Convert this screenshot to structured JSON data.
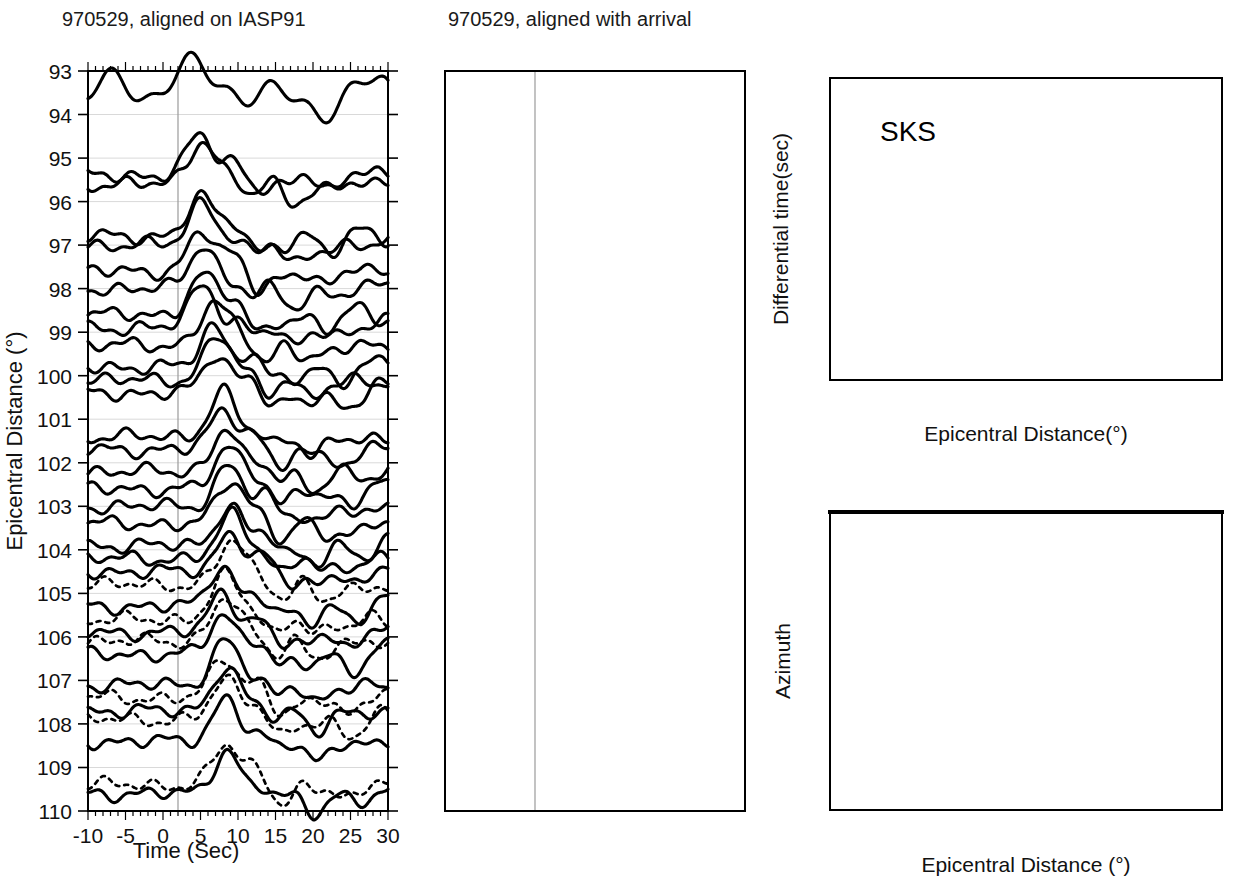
{
  "figure": {
    "panels": {
      "left": {
        "title": "970529, aligned on IASP91",
        "xlabel": "Time (Sec)",
        "ylabel": "Epicentral Distance (°)",
        "xticks": [
          "-10",
          "-5",
          "0",
          "5",
          "10",
          "15",
          "20",
          "25",
          "30"
        ],
        "xtick_values": [
          -10,
          -5,
          0,
          5,
          10,
          15,
          20,
          25,
          30
        ],
        "yticks": [
          "93",
          "94",
          "95",
          "96",
          "97",
          "98",
          "99",
          "100",
          "101",
          "102",
          "103",
          "104",
          "105",
          "106",
          "107",
          "108",
          "109",
          "110"
        ],
        "ytick_values": [
          93,
          94,
          95,
          96,
          97,
          98,
          99,
          100,
          101,
          102,
          103,
          104,
          105,
          106,
          107,
          108,
          109,
          110
        ],
        "xlim": [
          -10,
          30
        ],
        "ylim": [
          93,
          110
        ],
        "align_marker_time": 0
      },
      "middle": {
        "title": "970529, aligned with arrival",
        "xlabel": "Time (Sec)",
        "xticks": [
          "-10",
          "-5",
          "0",
          "5",
          "10",
          "15",
          "20",
          "25",
          "30"
        ],
        "xtick_values": [
          -10,
          -5,
          0,
          5,
          10,
          15,
          20,
          25,
          30
        ],
        "xlim": [
          -10,
          30
        ],
        "ylim": [
          93,
          110
        ],
        "align_marker_time": 0
      },
      "topright": {
        "annotation": "SKS",
        "xlabel": "Epicentral Distance(°)",
        "ylabel": "Differential time(sec)",
        "xticks": [
          "96",
          "98",
          "100",
          "102",
          "104",
          "106",
          "108",
          "110"
        ],
        "xtick_values": [
          96,
          98,
          100,
          102,
          104,
          106,
          108,
          110
        ],
        "yticks": [
          "10",
          "8",
          "6",
          "4",
          "2",
          "0",
          "-2",
          "-4"
        ],
        "ytick_values": [
          10,
          8,
          6,
          4,
          2,
          0,
          -2,
          -4
        ],
        "xlim": [
          95,
          110
        ],
        "ylim": [
          -5,
          10
        ]
      },
      "bottomright": {
        "xlabel": "Epicentral Distance (°)",
        "ylabel": "Azimuth",
        "xticks": [
          "96",
          "98",
          "100",
          "102",
          "104",
          "106",
          "108",
          "110"
        ],
        "xtick_values": [
          96,
          98,
          100,
          102,
          104,
          106,
          108,
          110
        ],
        "yticks": [
          "130",
          "132",
          "134",
          "136"
        ],
        "ytick_values": [
          130,
          132,
          134,
          136
        ],
        "xlim": [
          95,
          110
        ],
        "ylim": [
          136,
          130
        ]
      }
    }
  },
  "chart_data": [
    {
      "type": "line",
      "id": "left-record-section",
      "title": "970529, aligned on IASP91",
      "xlabel": "Time (Sec)",
      "ylabel": "Epicentral Distance (°)",
      "xlim": [
        -10,
        30
      ],
      "ylim": [
        93,
        110
      ],
      "grid": true,
      "legend": "none",
      "note": "Record section; each trace is a seismogram plotted at its epicentral distance. Dotted traces are synthetics/second phase shown for 104.5-110 deg.",
      "traces": [
        {
          "distance": 93.6,
          "style": "solid"
        },
        {
          "distance": 95.4,
          "style": "solid"
        },
        {
          "distance": 95.6,
          "style": "solid"
        },
        {
          "distance": 96.8,
          "style": "solid"
        },
        {
          "distance": 97.0,
          "style": "solid"
        },
        {
          "distance": 97.6,
          "style": "solid"
        },
        {
          "distance": 98.0,
          "style": "solid"
        },
        {
          "distance": 98.6,
          "style": "solid"
        },
        {
          "distance": 98.9,
          "style": "solid"
        },
        {
          "distance": 99.3,
          "style": "solid"
        },
        {
          "distance": 99.8,
          "style": "solid"
        },
        {
          "distance": 100.1,
          "style": "solid"
        },
        {
          "distance": 100.4,
          "style": "solid"
        },
        {
          "distance": 101.4,
          "style": "solid"
        },
        {
          "distance": 101.7,
          "style": "solid"
        },
        {
          "distance": 102.2,
          "style": "solid"
        },
        {
          "distance": 102.6,
          "style": "solid"
        },
        {
          "distance": 103.0,
          "style": "solid"
        },
        {
          "distance": 103.4,
          "style": "solid"
        },
        {
          "distance": 103.9,
          "style": "solid"
        },
        {
          "distance": 104.2,
          "style": "solid"
        },
        {
          "distance": 104.5,
          "style": "solid"
        },
        {
          "distance": 104.8,
          "style": "dotted"
        },
        {
          "distance": 105.3,
          "style": "solid"
        },
        {
          "distance": 105.6,
          "style": "dotted"
        },
        {
          "distance": 105.9,
          "style": "solid"
        },
        {
          "distance": 106.1,
          "style": "dotted"
        },
        {
          "distance": 106.4,
          "style": "solid"
        },
        {
          "distance": 107.1,
          "style": "solid"
        },
        {
          "distance": 107.4,
          "style": "dotted"
        },
        {
          "distance": 107.7,
          "style": "solid"
        },
        {
          "distance": 107.9,
          "style": "dotted"
        },
        {
          "distance": 108.4,
          "style": "solid"
        },
        {
          "distance": 109.4,
          "style": "dotted"
        },
        {
          "distance": 109.6,
          "style": "solid"
        }
      ]
    },
    {
      "type": "line",
      "id": "middle-record-section",
      "title": "970529, aligned with arrival",
      "xlabel": "Time (Sec)",
      "ylabel": "",
      "xlim": [
        -10,
        30
      ],
      "ylim": [
        93,
        110
      ],
      "grid": true,
      "legend": "none",
      "note": "Same traces realigned on the picked arrival time so the SKS onset lines up at t=0.",
      "traces": [
        {
          "distance": 93.6,
          "style": "solid"
        },
        {
          "distance": 95.3,
          "style": "solid"
        },
        {
          "distance": 95.7,
          "style": "solid"
        },
        {
          "distance": 96.7,
          "style": "solid"
        },
        {
          "distance": 97.0,
          "style": "solid"
        },
        {
          "distance": 97.6,
          "style": "solid"
        },
        {
          "distance": 98.1,
          "style": "solid"
        },
        {
          "distance": 98.5,
          "style": "solid"
        },
        {
          "distance": 98.9,
          "style": "solid"
        },
        {
          "distance": 99.4,
          "style": "solid"
        },
        {
          "distance": 99.8,
          "style": "solid"
        },
        {
          "distance": 100.2,
          "style": "solid"
        },
        {
          "distance": 100.5,
          "style": "solid"
        },
        {
          "distance": 101.3,
          "style": "solid"
        },
        {
          "distance": 101.8,
          "style": "solid"
        },
        {
          "distance": 102.2,
          "style": "solid"
        },
        {
          "distance": 102.6,
          "style": "solid"
        },
        {
          "distance": 103.1,
          "style": "solid"
        },
        {
          "distance": 103.5,
          "style": "solid"
        },
        {
          "distance": 103.9,
          "style": "solid"
        },
        {
          "distance": 104.3,
          "style": "solid"
        },
        {
          "distance": 104.7,
          "style": "solid"
        },
        {
          "distance": 105.1,
          "style": "solid"
        },
        {
          "distance": 105.5,
          "style": "solid"
        },
        {
          "distance": 105.9,
          "style": "solid"
        },
        {
          "distance": 106.3,
          "style": "solid"
        },
        {
          "distance": 107.0,
          "style": "solid"
        },
        {
          "distance": 107.5,
          "style": "solid"
        },
        {
          "distance": 108.0,
          "style": "solid"
        },
        {
          "distance": 108.5,
          "style": "solid"
        },
        {
          "distance": 109.3,
          "style": "solid"
        },
        {
          "distance": 109.7,
          "style": "solid"
        }
      ]
    },
    {
      "type": "scatter",
      "id": "sks-differential-time",
      "title": "SKS",
      "xlabel": "Epicentral Distance(°)",
      "ylabel": "Differential time(sec)",
      "xlim": [
        95,
        110
      ],
      "ylim": [
        -5,
        10
      ],
      "grid": false,
      "legend": "none",
      "series": [
        {
          "name": "solid-triangle",
          "marker": "filled-triangle",
          "points": [
            [
              95.05,
              2.05
            ],
            [
              95.65,
              1.75
            ],
            [
              95.6,
              1.5
            ],
            [
              96.35,
              1.45
            ],
            [
              96.85,
              1.8
            ],
            [
              96.9,
              0.3
            ],
            [
              97.45,
              1.55
            ],
            [
              97.6,
              1.5
            ],
            [
              97.8,
              0.15
            ],
            [
              98.45,
              1.5
            ],
            [
              98.6,
              1.8
            ],
            [
              98.7,
              1.25
            ],
            [
              99.1,
              1.15
            ],
            [
              99.15,
              0.75
            ],
            [
              99.55,
              1.4
            ],
            [
              99.6,
              2.15
            ],
            [
              100.2,
              1.95
            ],
            [
              100.25,
              2.1
            ],
            [
              100.35,
              2.0
            ],
            [
              101.0,
              3.3
            ],
            [
              101.5,
              4.0
            ],
            [
              101.6,
              3.85
            ],
            [
              102.3,
              4.1
            ],
            [
              102.5,
              5.1
            ],
            [
              103.0,
              5.15
            ],
            [
              103.3,
              5.0
            ],
            [
              103.5,
              5.15
            ],
            [
              103.7,
              5.25
            ],
            [
              103.85,
              5.3
            ],
            [
              104.3,
              4.9
            ],
            [
              104.5,
              4.8
            ],
            [
              104.75,
              4.6
            ],
            [
              104.9,
              4.65
            ],
            [
              104.95,
              4.2
            ],
            [
              105.4,
              4.4
            ],
            [
              106.0,
              4.55
            ],
            [
              107.15,
              4.85
            ],
            [
              107.4,
              4.75
            ],
            [
              107.5,
              4.75
            ],
            [
              107.75,
              4.8
            ],
            [
              108.6,
              5.0
            ],
            [
              109.35,
              4.85
            ]
          ]
        },
        {
          "name": "open-triangle",
          "marker": "open-triangle",
          "points": [
            [
              105.2,
              5.7
            ],
            [
              105.6,
              5.35
            ],
            [
              105.8,
              5.25
            ],
            [
              106.1,
              5.65
            ],
            [
              107.15,
              5.65
            ],
            [
              107.45,
              5.95
            ],
            [
              108.5,
              6.1
            ],
            [
              109.3,
              6.35
            ]
          ]
        }
      ],
      "fit_curve": {
        "name": "model-fit",
        "style": "solid-thick",
        "points": [
          [
            95.05,
            0.82
          ],
          [
            97.0,
            0.82
          ],
          [
            98.9,
            0.8
          ],
          [
            99.2,
            0.9
          ],
          [
            100.0,
            2.1
          ],
          [
            101.0,
            3.35
          ],
          [
            102.0,
            4.55
          ],
          [
            102.6,
            5.2
          ],
          [
            103.1,
            5.6
          ],
          [
            103.5,
            5.72
          ],
          [
            104.5,
            5.7
          ],
          [
            106.0,
            5.66
          ],
          [
            108.0,
            5.62
          ],
          [
            109.6,
            5.58
          ]
        ]
      }
    },
    {
      "type": "scatter",
      "id": "azimuth-vs-distance",
      "title": "",
      "xlabel": "Epicentral Distance (°)",
      "ylabel": "Azimuth",
      "xlim": [
        95,
        110
      ],
      "ylim": [
        136,
        130
      ],
      "grid": false,
      "legend": "none",
      "series": [
        {
          "name": "solid-triangle",
          "marker": "filled-triangle",
          "points": [
            [
              95.0,
              134.1
            ],
            [
              95.6,
              133.35
            ],
            [
              95.65,
              134.9
            ],
            [
              96.35,
              134.05
            ],
            [
              96.75,
              133.45
            ],
            [
              96.9,
              134.75
            ],
            [
              97.75,
              132.65
            ],
            [
              97.95,
              134.1
            ],
            [
              98.1,
              134.55
            ],
            [
              98.5,
              133.55
            ],
            [
              99.1,
              132.65
            ],
            [
              99.2,
              134.05
            ],
            [
              99.55,
              133.45
            ],
            [
              99.6,
              134.6
            ],
            [
              100.2,
              131.55
            ],
            [
              100.25,
              133.95
            ],
            [
              101.0,
              133.35
            ],
            [
              101.05,
              134.85
            ],
            [
              101.5,
              132.1
            ],
            [
              101.9,
              134.05
            ],
            [
              102.4,
              131.85
            ],
            [
              102.5,
              133.4
            ],
            [
              102.7,
              134.85
            ],
            [
              103.3,
              131.7
            ],
            [
              103.4,
              134.05
            ],
            [
              103.6,
              133.45
            ],
            [
              103.75,
              134.9
            ],
            [
              104.0,
              132.1
            ],
            [
              104.45,
              134.15
            ],
            [
              104.8,
              132.75
            ],
            [
              104.95,
              131.5
            ],
            [
              105.05,
              134.7
            ],
            [
              105.5,
              130.9
            ],
            [
              105.6,
              132.15
            ],
            [
              106.2,
              131.35
            ],
            [
              107.65,
              132.05
            ],
            [
              107.6,
              132.75
            ],
            [
              108.2,
              133.35
            ],
            [
              108.85,
              133.5
            ],
            [
              109.4,
              133.3
            ]
          ]
        },
        {
          "name": "open-triangle",
          "marker": "open-triangle",
          "points": [
            [
              105.9,
              132.95
            ],
            [
              105.7,
              133.85
            ],
            [
              105.85,
              134.35
            ],
            [
              106.1,
              135.05
            ],
            [
              107.2,
              134.45
            ],
            [
              107.5,
              135.05
            ],
            [
              108.4,
              134.3
            ],
            [
              109.3,
              134.0
            ]
          ]
        }
      ]
    }
  ],
  "colors": {
    "ink": "#000000",
    "background": "#ffffff",
    "gridline": "#d9d9d9",
    "alignment_line": "#9a9a9a"
  }
}
